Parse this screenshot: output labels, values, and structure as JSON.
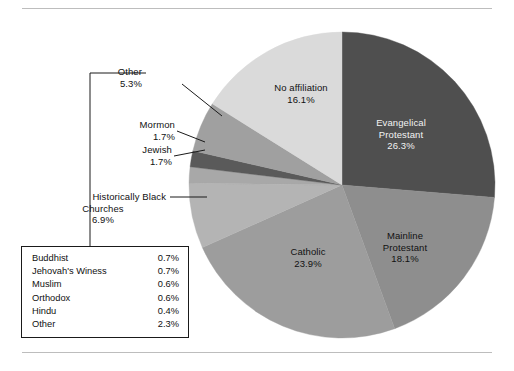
{
  "figure": {
    "has_top_rule": true,
    "has_bottom_rule": true
  },
  "chart_data": {
    "type": "pie",
    "title": "",
    "subtitle": "",
    "xlabel": "",
    "ylabel": "",
    "legend_position": "callout-left",
    "grid": false,
    "units": "percent",
    "start_angle_deg": 0,
    "direction": "clockwise",
    "categories": [
      "Evangelical Protestant",
      "Mainline Protestant",
      "Catholic",
      "Historically Black Churches",
      "Jewish",
      "Mormon",
      "Other",
      "No affiliation"
    ],
    "values": [
      26.3,
      18.1,
      23.9,
      6.9,
      1.7,
      1.7,
      5.3,
      16.1
    ],
    "slices": [
      {
        "name": "Evangelical Protestant",
        "label_line1": "Evangelical",
        "label_line2": "Protestant",
        "value": 26.3,
        "value_text": "26.3%",
        "color": "#4f4f4f",
        "label_placement": "inside",
        "label_on_dark": true
      },
      {
        "name": "Mainline Protestant",
        "label_line1": "Mainline",
        "label_line2": "Protestant",
        "value": 18.1,
        "value_text": "18.1%",
        "color": "#8e8e8e",
        "label_placement": "inside",
        "label_on_dark": false
      },
      {
        "name": "Catholic",
        "label_line1": "Catholic",
        "label_line2": "",
        "value": 23.9,
        "value_text": "23.9%",
        "color": "#9d9d9d",
        "label_placement": "inside",
        "label_on_dark": false
      },
      {
        "name": "Historically Black Churches",
        "label_line1": "Historically Black",
        "label_line2": "Churches",
        "value": 6.9,
        "value_text": "6.9%",
        "color": "#b4b4b4",
        "label_placement": "callout",
        "label_on_dark": false
      },
      {
        "name": "Jewish",
        "label_line1": "Jewish",
        "label_line2": "",
        "value": 1.7,
        "value_text": "1.7%",
        "color": "#a8a8a8",
        "label_placement": "callout",
        "label_on_dark": false
      },
      {
        "name": "Mormon",
        "label_line1": "Mormon",
        "label_line2": "",
        "value": 1.7,
        "value_text": "1.7%",
        "color": "#5a5a5a",
        "label_placement": "callout",
        "label_on_dark": false
      },
      {
        "name": "Other",
        "label_line1": "Other",
        "label_line2": "",
        "value": 5.3,
        "value_text": "5.3%",
        "color": "#a0a0a0",
        "label_placement": "callout",
        "label_on_dark": false
      },
      {
        "name": "No affiliation",
        "label_line1": "No affiliation",
        "label_line2": "",
        "value": 16.1,
        "value_text": "16.1%",
        "color": "#dadada",
        "label_placement": "inside",
        "label_on_dark": false
      }
    ],
    "breakdown_of": "Other",
    "breakdown_table": {
      "rows": [
        {
          "name": "Buddhist",
          "value_text": "0.7%",
          "value": 0.7
        },
        {
          "name": "Jehovah's Winess",
          "value_text": "0.7%",
          "value": 0.7
        },
        {
          "name": "Muslim",
          "value_text": "0.6%",
          "value": 0.6
        },
        {
          "name": "Orthodox",
          "value_text": "0.6%",
          "value": 0.6
        },
        {
          "name": "Hindu",
          "value_text": "0.4%",
          "value": 0.4
        },
        {
          "name": "Other",
          "value_text": "2.3%",
          "value": 2.3
        }
      ]
    }
  }
}
